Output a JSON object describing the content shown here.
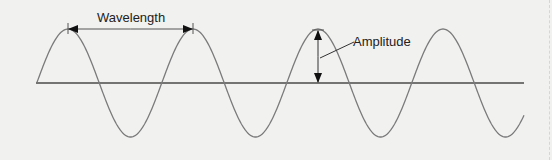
{
  "diagram": {
    "labels": {
      "wavelength": "Wavelength",
      "amplitude": "Amplitude"
    },
    "colors": {
      "background": "#f1f1f0",
      "wave": "#7a7a7a",
      "axis": "#4a4a4a",
      "arrow": "#111111",
      "text": "#222222"
    },
    "geometry": {
      "axis_y": 83,
      "axis_x_start": 36,
      "axis_x_end": 524,
      "wave_start_x": 37,
      "wave_end_x": 524,
      "wavelength_px": 125,
      "amplitude_px": 54,
      "first_peak_x": 68,
      "peaks_x": [
        68,
        193,
        317,
        443
      ]
    },
    "annotations": [
      {
        "type": "wavelength-arrow",
        "from_x": 68,
        "to_x": 193,
        "y": 29
      },
      {
        "type": "amplitude-arrow",
        "x": 318,
        "from_y": 30,
        "to_y": 83
      }
    ]
  }
}
